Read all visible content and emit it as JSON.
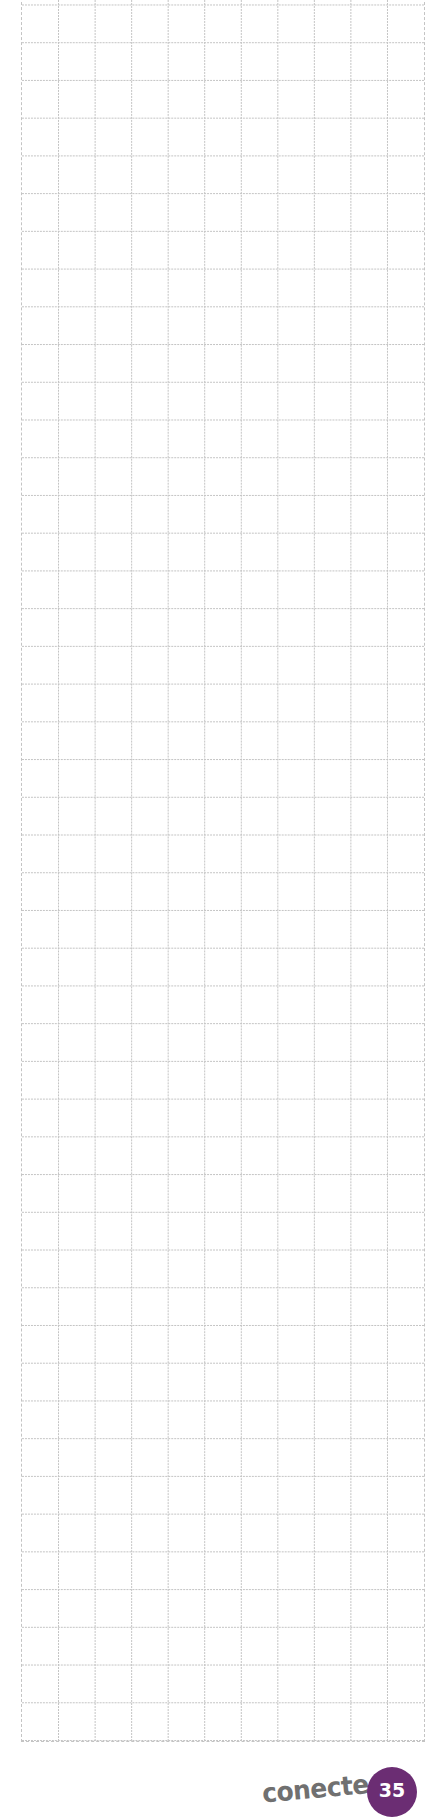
{
  "page": {
    "type": "grid-notes-page",
    "grid": {
      "columns": 11,
      "rows": 47,
      "line_color": "#c4c4c4",
      "line_style": "dashed"
    }
  },
  "footer": {
    "brand": "conecte",
    "page_number": "35",
    "badge_color": "#6b2d73"
  }
}
